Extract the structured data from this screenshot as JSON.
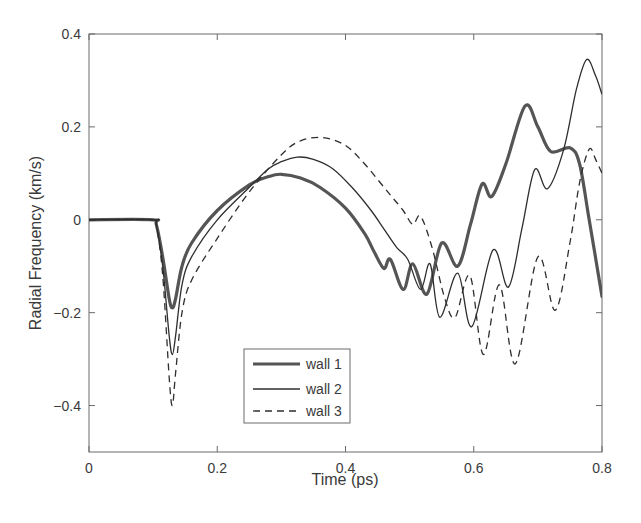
{
  "chart_data": {
    "type": "line",
    "title": "",
    "xlabel": "Time (ps)",
    "ylabel": "Radial Frequency (km/s)",
    "xlim": [
      0,
      0.8
    ],
    "ylim": [
      -0.5,
      0.4
    ],
    "xticks": [
      0,
      0.2,
      0.4,
      0.6,
      0.8
    ],
    "xtick_labels": [
      "0",
      "0.2",
      "0.4",
      "0.6",
      "0.8"
    ],
    "yticks": [
      0.4,
      0.2,
      0,
      -0.2,
      -0.4
    ],
    "ytick_labels": [
      "0.4",
      "0.2",
      "0",
      "-0.2",
      "-0.4"
    ],
    "grid": false,
    "legend_position": "lower center (inside axes)",
    "series": [
      {
        "name": "wall 1",
        "style": "solid-thick",
        "color": "#555555",
        "x": [
          0,
          0.1,
          0.105,
          0.115,
          0.125,
          0.13,
          0.135,
          0.145,
          0.16,
          0.2,
          0.25,
          0.28,
          0.3,
          0.33,
          0.36,
          0.4,
          0.43,
          0.445,
          0.46,
          0.47,
          0.49,
          0.505,
          0.527,
          0.55,
          0.575,
          0.595,
          0.613,
          0.628,
          0.65,
          0.68,
          0.7,
          0.72,
          0.75,
          0.765,
          0.78,
          0.8
        ],
        "y": [
          0,
          0,
          -0.01,
          -0.08,
          -0.17,
          -0.19,
          -0.17,
          -0.1,
          -0.05,
          0.02,
          0.075,
          0.093,
          0.098,
          0.09,
          0.07,
          0.025,
          -0.03,
          -0.07,
          -0.105,
          -0.085,
          -0.15,
          -0.095,
          -0.16,
          -0.05,
          -0.1,
          -0.01,
          0.077,
          0.05,
          0.12,
          0.245,
          0.2,
          0.147,
          0.155,
          0.12,
          0.0,
          -0.165
        ]
      },
      {
        "name": "wall 2",
        "style": "solid-thin",
        "color": "#333333",
        "x": [
          0,
          0.1,
          0.105,
          0.115,
          0.125,
          0.13,
          0.135,
          0.145,
          0.16,
          0.2,
          0.25,
          0.28,
          0.3,
          0.325,
          0.35,
          0.38,
          0.41,
          0.44,
          0.46,
          0.48,
          0.497,
          0.517,
          0.532,
          0.547,
          0.575,
          0.597,
          0.63,
          0.654,
          0.675,
          0.695,
          0.715,
          0.74,
          0.76,
          0.776,
          0.79,
          0.8
        ],
        "y": [
          0,
          0,
          -0.01,
          -0.1,
          -0.25,
          -0.29,
          -0.25,
          -0.14,
          -0.08,
          0.0,
          0.07,
          0.11,
          0.125,
          0.135,
          0.13,
          0.11,
          0.07,
          0.02,
          -0.02,
          -0.06,
          -0.085,
          -0.15,
          -0.095,
          -0.21,
          -0.115,
          -0.23,
          -0.065,
          -0.145,
          -0.02,
          0.108,
          0.067,
          0.15,
          0.28,
          0.345,
          0.31,
          0.27
        ]
      },
      {
        "name": "wall 3",
        "style": "dashed",
        "color": "#333333",
        "x": [
          0,
          0.1,
          0.105,
          0.115,
          0.125,
          0.13,
          0.135,
          0.145,
          0.16,
          0.2,
          0.25,
          0.3,
          0.33,
          0.365,
          0.4,
          0.43,
          0.46,
          0.475,
          0.49,
          0.505,
          0.517,
          0.535,
          0.555,
          0.571,
          0.594,
          0.615,
          0.64,
          0.665,
          0.7,
          0.727,
          0.75,
          0.765,
          0.78,
          0.79,
          0.8
        ],
        "y": [
          0,
          0,
          -0.01,
          -0.12,
          -0.34,
          -0.4,
          -0.33,
          -0.2,
          -0.13,
          -0.04,
          0.06,
          0.14,
          0.17,
          0.177,
          0.16,
          0.12,
          0.07,
          0.045,
          0.02,
          -0.01,
          0.008,
          -0.06,
          -0.17,
          -0.21,
          -0.12,
          -0.29,
          -0.14,
          -0.31,
          -0.08,
          -0.195,
          -0.05,
          0.08,
          0.152,
          0.13,
          0.1
        ]
      }
    ]
  },
  "legend": {
    "items": [
      {
        "label": "wall 1"
      },
      {
        "label": "wall 2"
      },
      {
        "label": "wall 3"
      }
    ]
  },
  "axes": {
    "xlabel": "Time (ps)",
    "ylabel": "Radial Frequency (km/s)"
  }
}
